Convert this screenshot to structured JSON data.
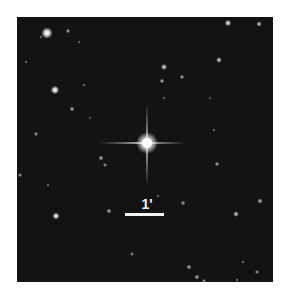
{
  "image": {
    "background": "#131313",
    "frame": {
      "x": 17,
      "y": 17,
      "width": 256,
      "height": 265
    }
  },
  "target_star": {
    "x": 147,
    "y": 143,
    "core_radius": 5,
    "glow_radius": 11,
    "spike_vertical": [
      104,
      186
    ],
    "spike_horizontal": [
      100,
      186
    ]
  },
  "stars": [
    {
      "x": 47,
      "y": 33,
      "r": 3.2,
      "b": 1.0
    },
    {
      "x": 68,
      "y": 31,
      "r": 1.3,
      "b": 0.55
    },
    {
      "x": 41,
      "y": 37,
      "r": 1.0,
      "b": 0.4
    },
    {
      "x": 79,
      "y": 42,
      "r": 1.0,
      "b": 0.35
    },
    {
      "x": 26,
      "y": 62,
      "r": 1.0,
      "b": 0.4
    },
    {
      "x": 55,
      "y": 90,
      "r": 2.4,
      "b": 0.95
    },
    {
      "x": 72,
      "y": 109,
      "r": 1.4,
      "b": 0.6
    },
    {
      "x": 84,
      "y": 85,
      "r": 1.0,
      "b": 0.35
    },
    {
      "x": 36,
      "y": 134,
      "r": 1.3,
      "b": 0.5
    },
    {
      "x": 228,
      "y": 23,
      "r": 1.8,
      "b": 0.85
    },
    {
      "x": 259,
      "y": 24,
      "r": 1.5,
      "b": 0.7
    },
    {
      "x": 219,
      "y": 60,
      "r": 1.6,
      "b": 0.75
    },
    {
      "x": 164,
      "y": 67,
      "r": 1.7,
      "b": 0.8
    },
    {
      "x": 162,
      "y": 81,
      "r": 1.3,
      "b": 0.6
    },
    {
      "x": 182,
      "y": 77,
      "r": 1.3,
      "b": 0.55
    },
    {
      "x": 101,
      "y": 158,
      "r": 1.4,
      "b": 0.6
    },
    {
      "x": 105,
      "y": 165,
      "r": 1.2,
      "b": 0.5
    },
    {
      "x": 20,
      "y": 175,
      "r": 1.2,
      "b": 0.5
    },
    {
      "x": 48,
      "y": 185,
      "r": 1.0,
      "b": 0.4
    },
    {
      "x": 56,
      "y": 216,
      "r": 2.0,
      "b": 0.9
    },
    {
      "x": 109,
      "y": 211,
      "r": 1.4,
      "b": 0.6
    },
    {
      "x": 132,
      "y": 254,
      "r": 1.2,
      "b": 0.45
    },
    {
      "x": 214,
      "y": 130,
      "r": 1.0,
      "b": 0.4
    },
    {
      "x": 217,
      "y": 164,
      "r": 1.3,
      "b": 0.55
    },
    {
      "x": 183,
      "y": 203,
      "r": 1.3,
      "b": 0.55
    },
    {
      "x": 236,
      "y": 214,
      "r": 1.6,
      "b": 0.7
    },
    {
      "x": 260,
      "y": 201,
      "r": 1.5,
      "b": 0.65
    },
    {
      "x": 189,
      "y": 267,
      "r": 1.4,
      "b": 0.6
    },
    {
      "x": 197,
      "y": 277,
      "r": 1.4,
      "b": 0.6
    },
    {
      "x": 204,
      "y": 281,
      "r": 1.2,
      "b": 0.5
    },
    {
      "x": 257,
      "y": 272,
      "r": 1.2,
      "b": 0.5
    },
    {
      "x": 243,
      "y": 262,
      "r": 1.0,
      "b": 0.4
    },
    {
      "x": 237,
      "y": 280,
      "r": 1.0,
      "b": 0.4
    },
    {
      "x": 164,
      "y": 98,
      "r": 1.0,
      "b": 0.35
    },
    {
      "x": 210,
      "y": 98,
      "r": 1.0,
      "b": 0.3
    },
    {
      "x": 158,
      "y": 196,
      "r": 1.0,
      "b": 0.35
    },
    {
      "x": 90,
      "y": 118,
      "r": 1.0,
      "b": 0.3
    }
  ],
  "scale_bar": {
    "label": "1'",
    "x": 125,
    "y": 213,
    "width": 39,
    "height": 3,
    "label_x": 132,
    "label_y": 197,
    "color": "#f2f2f2"
  }
}
